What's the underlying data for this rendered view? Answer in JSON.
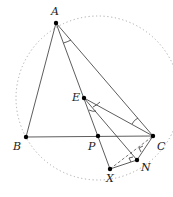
{
  "diagram": {
    "title": "",
    "circle": {
      "cx": 98,
      "cy": 98,
      "r": 82,
      "style": "dotted",
      "color": "#aaaaaa"
    },
    "points": [
      {
        "id": "A",
        "label": "A",
        "x": 56,
        "y": 23,
        "lx": 51,
        "ly": 15
      },
      {
        "id": "B",
        "label": "B",
        "x": 26,
        "y": 137,
        "lx": 13,
        "ly": 150
      },
      {
        "id": "C",
        "label": "C",
        "x": 153,
        "y": 136,
        "lx": 157,
        "ly": 150
      },
      {
        "id": "P",
        "label": "P",
        "x": 98,
        "y": 136,
        "lx": 88,
        "ly": 150
      },
      {
        "id": "E",
        "label": "E",
        "x": 84,
        "y": 98,
        "lx": 72,
        "ly": 101
      },
      {
        "id": "X",
        "label": "X",
        "x": 110,
        "y": 169,
        "lx": 106,
        "ly": 182
      },
      {
        "id": "N",
        "label": "N",
        "x": 137,
        "y": 160,
        "lx": 141,
        "ly": 171
      }
    ],
    "segments": [
      [
        "A",
        "B"
      ],
      [
        "B",
        "C"
      ],
      [
        "A",
        "C"
      ],
      [
        "A",
        "X"
      ],
      [
        "E",
        "C"
      ],
      [
        "E",
        "N"
      ],
      [
        "X",
        "N"
      ],
      [
        "N",
        "C"
      ]
    ],
    "dashed_segments": [
      [
        "X",
        "C"
      ]
    ],
    "angle_marks": [
      "BAP-equal-CAP",
      "PEN-equal-NEC",
      "ACE"
    ],
    "right_angle_marks": [
      "at N (XN ⟂ NC)",
      "near C on XC"
    ]
  }
}
